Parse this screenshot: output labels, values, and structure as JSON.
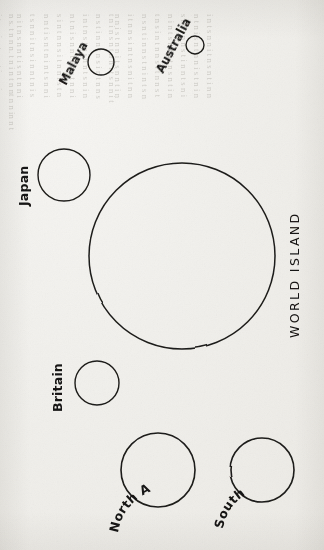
{
  "page": {
    "kind": "scanned-book-page-figure",
    "width": 324,
    "height": 550,
    "orientation_note": "figure drawn sideways; text reads bottom-to-top",
    "paper_color": "#f3f2ef",
    "ink_color": "#1d1c1a",
    "bleed_text_color": "#9d9a92"
  },
  "figure": {
    "name": "world-island-comparison-diagram",
    "title": "WORLD ISLAND",
    "regions": [
      {
        "id": "world-island",
        "label": "WORLD ISLAND",
        "cx": 182,
        "cy": 256,
        "r": 93,
        "stroke_width": 1.5,
        "label_style": "spaced-caps",
        "label_rotation": -90,
        "label_x": 299,
        "label_y": 338,
        "font_size": 12.5
      },
      {
        "id": "japan",
        "label": "Japan",
        "cx": 64,
        "cy": 175,
        "r": 26,
        "stroke_width": 1.4,
        "label_style": "arc",
        "label_rotation": -90,
        "label_x": 28,
        "label_y": 206,
        "font_size": 12.5,
        "arc_curvature": 0
      },
      {
        "id": "malaya",
        "label": "Malaya",
        "cx": 101,
        "cy": 62,
        "r": 13,
        "stroke_width": 1.4,
        "label_style": "arc",
        "label_rotation": -62,
        "label_x": 64,
        "label_y": 84,
        "font_size": 11.5
      },
      {
        "id": "australia",
        "label": "Australia",
        "cx": 195,
        "cy": 45,
        "r": 9,
        "stroke_width": 1.4,
        "label_style": "arc",
        "label_rotation": -62,
        "label_x": 162,
        "label_y": 72,
        "font_size": 11.5
      },
      {
        "id": "britain",
        "label": "Britain",
        "cx": 97,
        "cy": 383,
        "r": 22,
        "stroke_width": 1.4,
        "label_style": "arc",
        "label_rotation": -90,
        "label_x": 62,
        "label_y": 412,
        "font_size": 12.5
      },
      {
        "id": "north-america",
        "label": "North America",
        "cx": 158,
        "cy": 470,
        "r": 37,
        "stroke_width": 1.6,
        "label_style": "arc-curved",
        "label_rotation": -90,
        "label_x": 116,
        "label_y": 533,
        "font_size": 12.5
      },
      {
        "id": "south-america",
        "label": "South America",
        "cx": 262,
        "cy": 470,
        "r": 32,
        "stroke_width": 1.6,
        "label_style": "arc-curved",
        "label_rotation": -90,
        "label_x": 221,
        "label_y": 530,
        "font_size": 12.5
      }
    ]
  },
  "bleed_through": {
    "visible": true,
    "legible": false,
    "description": "faint mirrored letterpress text showing through from the opposite side of the leaf",
    "columns": [
      {
        "x": 18,
        "y": 14,
        "lines": [
          "n s. t n n n.  t n i n  t  n  nt  n  n in n  t",
          "i  t n  s  i n t n  n t  i n  n  i n  n  s",
          "n t  n  in  s n  t n  i  s  t  n  n t i  n",
          "t  n  s  n  i n  t  n  n  s i  n  t  n  i  n",
          "n  i  t  n  s  n  t  i  n  n  t  s  n  i  n  t",
          "s  n  t  n  i  n  t  n  s  n  i  t  n  n  s",
          "i n  t  n  n  s  t  i  n  n  t  n  i  s  n  t",
          "n  t  s  i  n  n  t  n  i  n  s  t  n  n  i"
        ]
      },
      {
        "x": 118,
        "y": 14,
        "lines": [
          "t  n  i  n  s  n  t  n  n  i  t  s  n  n  i  t",
          "n  s  t  i  n  n  t  n  s  i  n  t  n  n  s",
          "i  n  t  n  s  t  n  i  n  n  t  s  n  i  n",
          "n  t  n  i  s  n  n  t  i  n  s  t  n  n  i",
          "s  i  n  t  n  n  s  i  t  n  n  i  s  t  n",
          "n  n  t  i  s  n  t  n  i  n  t  s  n  n  i",
          "t  s  n  n  i  t  n  s  i  n  n  t  n  i  s",
          "n  i  t  n  s  n  n  t  i  s  n  t  n  n  i"
        ]
      },
      {
        "x": 216,
        "y": 14,
        "lines": [
          "i  n  t  s  n  n  i  t  n  s  n  t  i  n  n",
          "n  t  n  i  s  n  t  n  n  i  s  t  n  i  n",
          "s  n  i  t  n  n  s  t  i  n  n  t  s  n  i",
          "n  i  n  t  s  n  n  i  t  n  s  n  t  i  n",
          "t  n  s  i  n  t  n  n  s  i  t  n  n  s  t",
          "n  s  n  t  i  n  n  s  t  n  i  n  t  s  n",
          "i  t  n  n  s  i  n  t  n  s  n  i  t  n  n",
          "n  n  i  s  t  n  n  i  t  s  n  n  t  i  n"
        ]
      }
    ]
  }
}
